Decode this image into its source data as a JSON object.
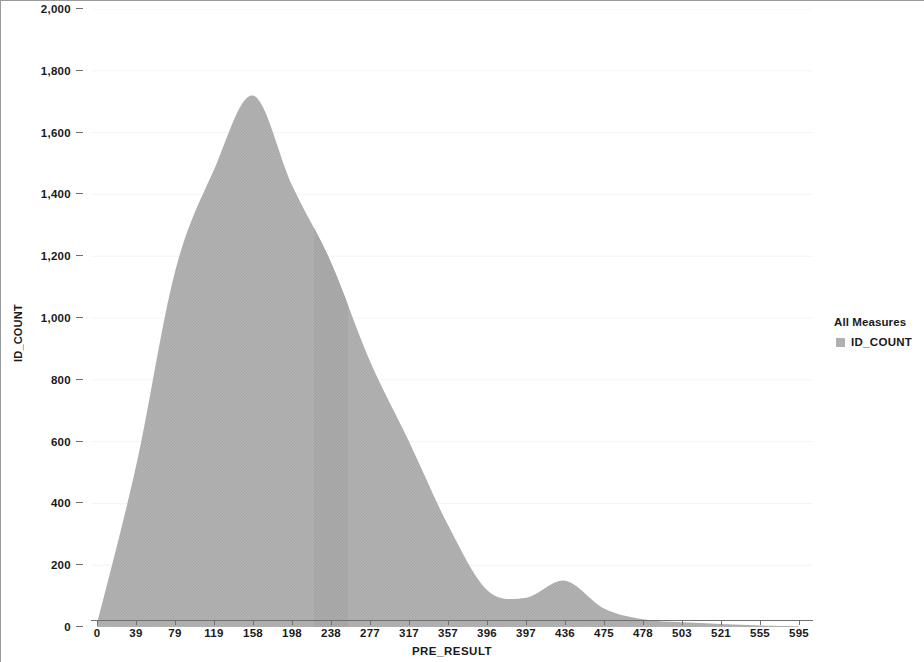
{
  "chart_data": {
    "type": "area",
    "title": "",
    "xlabel": "PRE_RESULT",
    "ylabel": "ID_COUNT",
    "xlim": [
      0,
      19
    ],
    "ylim": [
      0,
      2000
    ],
    "grid": true,
    "legend_position": "right",
    "y_ticks": [
      0,
      200,
      400,
      600,
      800,
      1000,
      1200,
      1400,
      1600,
      1800,
      2000
    ],
    "y_tick_labels": [
      "0",
      "200",
      "400",
      "600",
      "800",
      "1,000",
      "1,200",
      "1,400",
      "1,600",
      "1,800",
      "2,000"
    ],
    "categories": [
      "0",
      "39",
      "79",
      "119",
      "158",
      "198",
      "238",
      "277",
      "317",
      "357",
      "396",
      "397",
      "436",
      "475",
      "478",
      "503",
      "521",
      "555",
      "595"
    ],
    "series": [
      {
        "name": "ID_COUNT",
        "color": "#a8a8a8",
        "values": [
          10,
          520,
          1150,
          1480,
          1720,
          1430,
          1180,
          860,
          600,
          330,
          120,
          95,
          150,
          60,
          25,
          15,
          10,
          5,
          2
        ]
      }
    ],
    "legend": {
      "title": "All Measures",
      "entries": [
        "ID_COUNT"
      ]
    }
  },
  "axes": {
    "y_title": "ID_COUNT",
    "x_title": "PRE_RESULT"
  },
  "legend": {
    "title": "All Measures",
    "item_label": "ID_COUNT"
  }
}
